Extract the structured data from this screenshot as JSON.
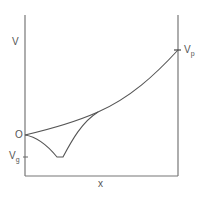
{
  "diagram": {
    "type": "potential-profile",
    "axis_labels": {
      "y": "V",
      "x": "x"
    },
    "y_markers": {
      "origin": "O",
      "vg_main": "V",
      "vg_sub": "g",
      "vp_main": "V",
      "vp_sub": "p"
    },
    "curves": [
      {
        "name": "upper-curve",
        "description": "monotonic rise from O to Vp"
      },
      {
        "name": "lower-curve",
        "description": "dips from O to minimum Vg, then rises to merge with upper curve"
      }
    ],
    "colors": {
      "line": "#666666",
      "text": "#555555",
      "background": "#ffffff"
    }
  }
}
